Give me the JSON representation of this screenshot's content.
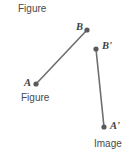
{
  "canvas": {
    "width": 135,
    "height": 158,
    "background": "#ffffff"
  },
  "style": {
    "segment_color": "#6e6e6e",
    "point_color": "#5a5a5a",
    "label_color": "#4a4a4a",
    "point_label_color": "#3f3f3f",
    "segment_stroke_width": 1.6,
    "point_radius": 2.6
  },
  "captions": {
    "figure_top": "Figure",
    "figure_lower": "Figure",
    "image": "Image"
  },
  "points": {
    "a": {
      "label": "A",
      "x": 36,
      "y": 84
    },
    "b": {
      "label": "B",
      "x": 87,
      "y": 30
    },
    "a_prime": {
      "label": "A'",
      "x": 104,
      "y": 127
    },
    "b_prime": {
      "label": "B'",
      "x": 96,
      "y": 49
    }
  },
  "segments": {
    "preimage": {
      "name": "AB",
      "from": "A",
      "to": "B"
    },
    "image": {
      "name": "A'B'",
      "from": "A'",
      "to": "B'"
    }
  }
}
